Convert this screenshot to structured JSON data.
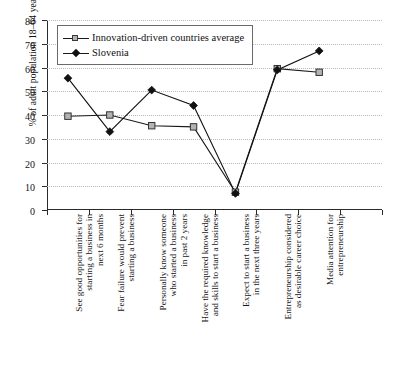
{
  "chart_data": {
    "type": "line",
    "title": "",
    "subtitle": "",
    "xlabel": "",
    "ylabel": "% of adult population 18–64 years",
    "ylim": [
      0,
      80
    ],
    "ytick_step": 10,
    "ytick_labels": [
      "80",
      "70",
      "60",
      "50",
      "40",
      "30",
      "20",
      "10",
      "0"
    ],
    "grid": "horizontal-dotted",
    "legend_position": "top-left-inside",
    "categories": [
      "See good opportunities for starting a business in next 6 months",
      "Fear failure would prevent starting a business",
      "Personally know someone who started a business in past 2 years",
      "Have the required knowledge and skills to start a business",
      "Expect to start a business in the next three years",
      "Entrepreneurship considered as desirable career choice",
      "Media attention for entrepreneurship"
    ],
    "category_lines": [
      [
        "See good opportunities for",
        "starting a business in",
        "next 6 months"
      ],
      [
        "Fear failure would prevent",
        "starting a business"
      ],
      [
        "Personally know someone",
        "who started a business",
        "in past 2 years"
      ],
      [
        "Have the required knowledge",
        "and skills to start a business"
      ],
      [
        "Expect to start a business",
        "in the next three years"
      ],
      [
        "Entrepreneurship considered",
        "as desirable career choice"
      ],
      [
        "Media attention for",
        "entrepreneurship"
      ]
    ],
    "series": [
      {
        "name": "Innovation-driven countries average",
        "marker": "open-square",
        "color": "#1a1a1a",
        "marker_fill": "#b3b3b3",
        "values": [
          39.5,
          40,
          35.5,
          35,
          7.5,
          59.5,
          58
        ]
      },
      {
        "name": "Slovenia",
        "marker": "filled-diamond",
        "color": "#111111",
        "marker_fill": "#111111",
        "values": [
          55.5,
          33,
          50.5,
          44,
          7,
          59,
          67
        ]
      }
    ]
  },
  "legend": {
    "items": [
      {
        "label": "Innovation-driven countries average",
        "marker": "open-square"
      },
      {
        "label": "Slovenia",
        "marker": "filled-diamond"
      }
    ]
  },
  "colors": {
    "axis": "#2b2b2b",
    "grid": "#b9b9b9",
    "series_line": "#1a1a1a",
    "square_fill": "#b3b3b3",
    "diamond_fill": "#111111",
    "background": "#ffffff"
  }
}
